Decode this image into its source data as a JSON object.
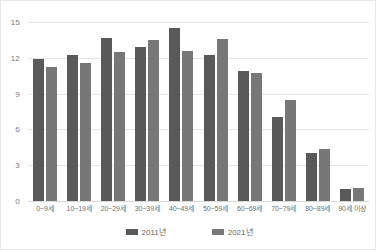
{
  "chart_data": {
    "type": "bar",
    "title": "",
    "subtitle": "",
    "xlabel": "",
    "ylabel": "",
    "categories": [
      "0~9세",
      "10~19세",
      "20~29세",
      "30~39세",
      "40~49세",
      "50~59세",
      "60~69세",
      "70~79세",
      "80~89세",
      "90세 이상"
    ],
    "series": [
      {
        "name": "2011년",
        "color": "#595959",
        "values": [
          11.9,
          12.2,
          13.7,
          12.9,
          14.5,
          12.2,
          10.9,
          7.0,
          4.0,
          1.0
        ]
      },
      {
        "name": "2021년",
        "color": "#777777",
        "values": [
          11.2,
          11.6,
          12.5,
          13.5,
          12.6,
          13.6,
          10.7,
          8.5,
          4.35,
          1.1
        ]
      }
    ],
    "ylim": [
      0,
      15
    ],
    "yticks": [
      0,
      3,
      6,
      9,
      12,
      15
    ],
    "ytick_labels": [
      "0",
      "3",
      "6",
      "9",
      "12",
      "15"
    ],
    "grid": true,
    "legend_position": "bottom"
  }
}
